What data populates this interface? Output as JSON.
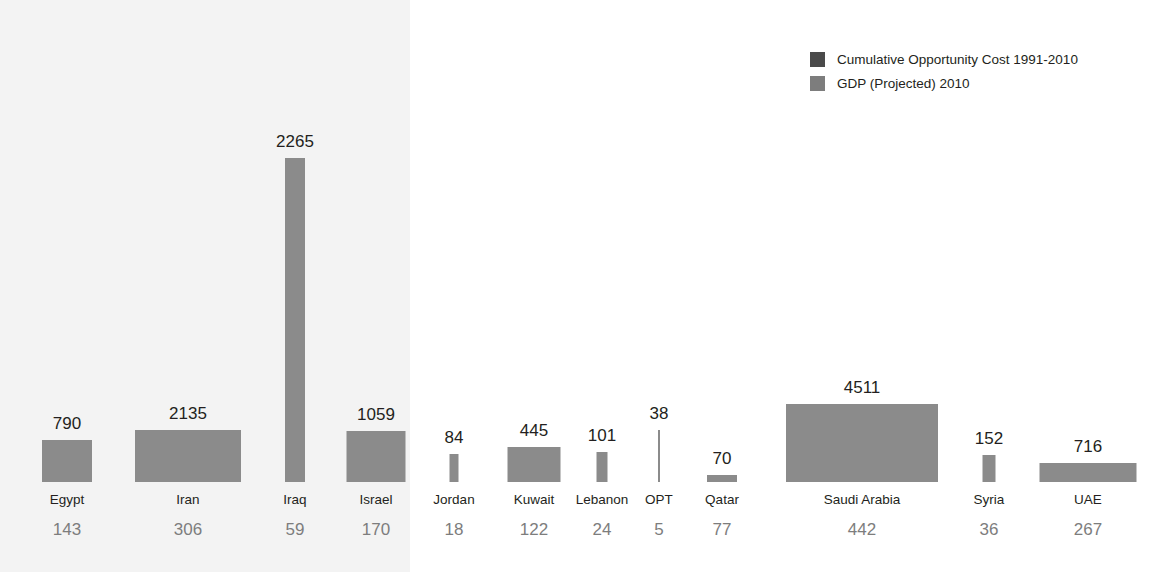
{
  "chart_data": {
    "type": "bar",
    "title": "",
    "subtitle": "",
    "xlabel": "",
    "ylabel": "",
    "grid": false,
    "legend_position": "top-right",
    "categories": [
      "Egypt",
      "Iran",
      "Iraq",
      "Israel",
      "Jordan",
      "Kuwait",
      "Lebanon",
      "OPT",
      "Qatar",
      "Saudi Arabia",
      "Syria",
      "UAE"
    ],
    "series": [
      {
        "name": "Cumulative Opportunity Cost 1991-2010",
        "encoding": "bar-height",
        "color": "#4a4a4a",
        "values": [
          790,
          2135,
          2265,
          1059,
          84,
          445,
          101,
          38,
          70,
          4511,
          152,
          716
        ]
      },
      {
        "name": "GDP (Projected) 2010",
        "encoding": "bar-width",
        "color": "#7d7d7d",
        "values": [
          143,
          306,
          59,
          170,
          18,
          122,
          24,
          5,
          77,
          442,
          36,
          267
        ]
      }
    ]
  },
  "legend": {
    "items": [
      {
        "label": "Cumulative Opportunity Cost 1991-2010",
        "color": "#4a4a4a"
      },
      {
        "label": "GDP (Projected) 2010",
        "color": "#7d7d7d"
      }
    ]
  },
  "bars": [
    {
      "name": "Egypt",
      "cost_label": "790",
      "gdp_label": "143",
      "center": 67,
      "width": 50,
      "height": 42
    },
    {
      "name": "Iran",
      "cost_label": "2135",
      "gdp_label": "306",
      "center": 188,
      "width": 106,
      "height": 52
    },
    {
      "name": "Iraq",
      "cost_label": "2265",
      "gdp_label": "59",
      "center": 295,
      "width": 20,
      "height": 324
    },
    {
      "name": "Israel",
      "cost_label": "1059",
      "gdp_label": "170",
      "center": 376,
      "width": 59,
      "height": 51
    },
    {
      "name": "Jordan",
      "cost_label": "84",
      "gdp_label": "18",
      "center": 454,
      "width": 9,
      "height": 28
    },
    {
      "name": "Kuwait",
      "cost_label": "445",
      "gdp_label": "122",
      "center": 534,
      "width": 53,
      "height": 35
    },
    {
      "name": "Lebanon",
      "cost_label": "101",
      "gdp_label": "24",
      "center": 602,
      "width": 11,
      "height": 30
    },
    {
      "name": "OPT",
      "cost_label": "38",
      "gdp_label": "5",
      "center": 659,
      "width": 2,
      "height": 52
    },
    {
      "name": "Qatar",
      "cost_label": "70",
      "gdp_label": "77",
      "center": 722,
      "width": 30,
      "height": 7
    },
    {
      "name": "Saudi Arabia",
      "cost_label": "4511",
      "gdp_label": "442",
      "center": 862,
      "width": 152,
      "height": 78
    },
    {
      "name": "Syria",
      "cost_label": "152",
      "gdp_label": "36",
      "center": 989,
      "width": 13,
      "height": 27
    },
    {
      "name": "UAE",
      "cost_label": "716",
      "gdp_label": "267",
      "center": 1088,
      "width": 97,
      "height": 19
    }
  ]
}
